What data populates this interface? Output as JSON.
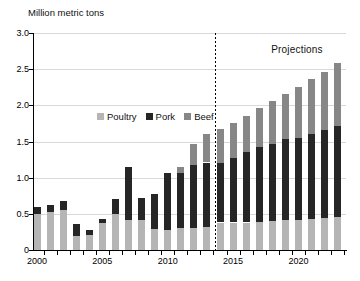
{
  "chart_data": {
    "type": "bar",
    "stacked": true,
    "title": "Million metric tons",
    "projection_label": "Projections",
    "projection_start_year": 2014,
    "categories": [
      2000,
      2001,
      2002,
      2003,
      2004,
      2005,
      2006,
      2007,
      2008,
      2009,
      2010,
      2011,
      2012,
      2013,
      2014,
      2015,
      2016,
      2017,
      2018,
      2019,
      2020,
      2021,
      2022,
      2023
    ],
    "series": [
      {
        "name": "Poultry",
        "color": "#b5b5b5",
        "values": [
          0.5,
          0.52,
          0.55,
          0.19,
          0.21,
          0.37,
          0.5,
          0.42,
          0.41,
          0.29,
          0.28,
          0.3,
          0.31,
          0.32,
          0.38,
          0.38,
          0.38,
          0.39,
          0.4,
          0.41,
          0.42,
          0.43,
          0.44,
          0.46
        ]
      },
      {
        "name": "Pork",
        "color": "#262626",
        "values": [
          0.1,
          0.1,
          0.13,
          0.17,
          0.07,
          0.06,
          0.21,
          0.73,
          0.31,
          0.49,
          0.78,
          0.77,
          0.86,
          0.89,
          0.82,
          0.89,
          0.97,
          1.03,
          1.07,
          1.12,
          1.13,
          1.17,
          1.22,
          1.26
        ]
      },
      {
        "name": "Beef",
        "color": "#878787",
        "values": [
          0,
          0,
          0,
          0,
          0,
          0,
          0,
          0,
          0,
          0,
          0,
          0.08,
          0.29,
          0.4,
          0.48,
          0.49,
          0.51,
          0.54,
          0.59,
          0.63,
          0.7,
          0.76,
          0.8,
          0.86
        ]
      }
    ],
    "ylim": [
      0,
      3.0
    ],
    "yticks": [
      0,
      0.5,
      1.0,
      1.5,
      2.0,
      2.5,
      3.0
    ],
    "ytick_labels": [
      "0",
      "0.5",
      "1.0",
      "1.5",
      "2.0",
      "2.5",
      "3.0"
    ],
    "xtick_labels": [
      "2000",
      "2005",
      "2010",
      "2015",
      "2020"
    ],
    "grid": "horizontal-light",
    "legend_position": "inside-upper-left",
    "colors": {
      "grid": "#d9d9d9",
      "axis": "#000000",
      "divider": "#000000"
    }
  }
}
